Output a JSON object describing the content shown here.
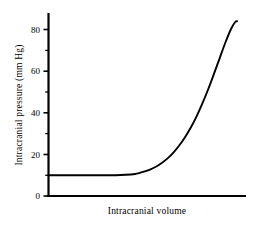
{
  "chart_data": {
    "type": "line",
    "title": "",
    "xlabel": "Intracranial volume",
    "ylabel": "Intracranial pressure (mm Hg)",
    "xlim": [
      0,
      100
    ],
    "ylim": [
      0,
      90
    ],
    "grid": false,
    "legend": false,
    "legend_position": "none",
    "line_color": "#000000",
    "background_color": "#ffffff",
    "y_ticks_major": [
      0,
      20,
      40,
      60,
      80
    ],
    "y_tick_labels": [
      "0",
      "20",
      "40",
      "60",
      "80"
    ],
    "y_ticks_minor": [
      10,
      30,
      50,
      70
    ],
    "x_ticks_major": [],
    "x_tick_labels": [],
    "series": [
      {
        "name": "Intracranial pressure-volume curve",
        "x": [
          0,
          5,
          10,
          15,
          20,
          25,
          30,
          35,
          40,
          45,
          47,
          50,
          53,
          56,
          59,
          62,
          65,
          68,
          71,
          74,
          77,
          80,
          83,
          86,
          89,
          92,
          95,
          97,
          98
        ],
        "values": [
          10,
          10,
          10,
          10,
          10,
          10,
          10,
          10,
          10.2,
          10.6,
          11,
          11.8,
          12.8,
          14.2,
          16,
          18.2,
          21,
          24.4,
          28.4,
          33,
          38.4,
          44.6,
          51.4,
          58.8,
          66.4,
          74,
          80.6,
          83.6,
          84
        ]
      }
    ]
  },
  "axes": {
    "y_axis_label": "Intracranial pressure (mm Hg)",
    "x_axis_label": "Intracranial volume",
    "y_tick_values": [
      "80",
      "60",
      "40",
      "20",
      "0"
    ]
  }
}
